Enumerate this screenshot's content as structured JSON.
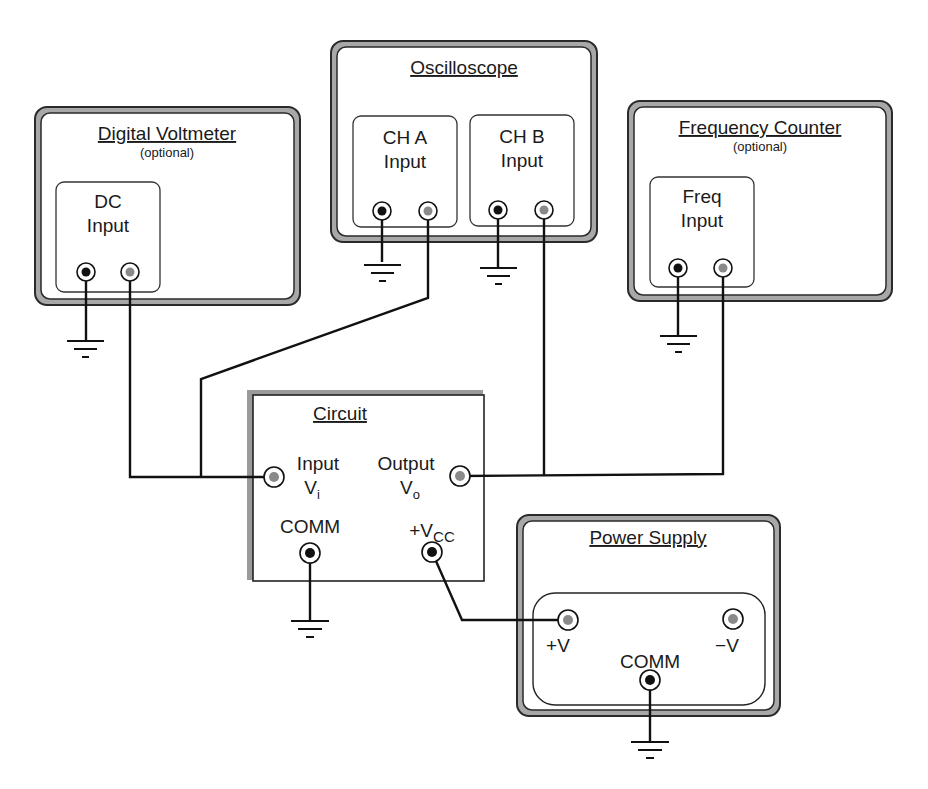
{
  "diagram": {
    "type": "test-equipment-wiring",
    "colors": {
      "frame_outer": "#2a2a2a",
      "frame_fill": "#a8a8a8",
      "wire": "#111111",
      "jack_signal": "#8a8a8a",
      "jack_ground": "#111111"
    }
  },
  "instruments": {
    "voltmeter": {
      "title": "Digital Voltmeter",
      "subtitle": "(optional)",
      "panel": {
        "line1": "DC",
        "line2": "Input"
      }
    },
    "oscilloscope": {
      "title": "Oscilloscope",
      "channel_a": {
        "line1": "CH A",
        "line2": "Input"
      },
      "channel_b": {
        "line1": "CH B",
        "line2": "Input"
      }
    },
    "frequency_counter": {
      "title": "Frequency Counter",
      "subtitle": "(optional)",
      "panel": {
        "line1": "Freq",
        "line2": "Input"
      }
    },
    "circuit": {
      "title": "Circuit",
      "input": {
        "line1": "Input",
        "line2": "V",
        "sub": "i"
      },
      "output": {
        "line1": "Output",
        "line2": "V",
        "sub": "o"
      },
      "comm": "COMM",
      "vcc": {
        "prefix": "+V",
        "sub": "CC"
      }
    },
    "power_supply": {
      "title": "Power Supply",
      "plus_v": "+V",
      "minus_v": "−V",
      "comm": "COMM"
    }
  }
}
